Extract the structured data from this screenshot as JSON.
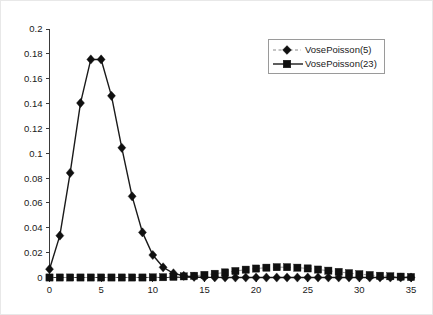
{
  "chart_data": {
    "type": "line",
    "title": "",
    "subtitle": "",
    "xlabel": "",
    "ylabel": "",
    "xlim": [
      0,
      35
    ],
    "ylim": [
      0,
      0.2
    ],
    "grid": false,
    "legend_position": "top-right",
    "x_ticks": [
      "0",
      "5",
      "10",
      "15",
      "20",
      "25",
      "30",
      "35"
    ],
    "x_tick_values": [
      0,
      5,
      10,
      15,
      20,
      25,
      30,
      35
    ],
    "y_ticks": [
      "0",
      "0.02",
      "0.04",
      "0.06",
      "0.08",
      "0.1",
      "0.12",
      "0.14",
      "0.16",
      "0.18",
      "0.2"
    ],
    "y_tick_values": [
      0,
      0.02,
      0.04,
      0.06,
      0.08,
      0.1,
      0.12,
      0.14,
      0.16,
      0.18,
      0.2
    ],
    "x": [
      0,
      1,
      2,
      3,
      4,
      5,
      6,
      7,
      8,
      9,
      10,
      11,
      12,
      13,
      14,
      15,
      16,
      17,
      18,
      19,
      20,
      21,
      22,
      23,
      24,
      25,
      26,
      27,
      28,
      29,
      30,
      31,
      32,
      33,
      34,
      35
    ],
    "series": [
      {
        "name": "VosePoisson(5)",
        "marker": "diamond",
        "line_style": "dashed",
        "color": "#101010",
        "line_color": "#9a9a9a",
        "values": [
          0.0067,
          0.0337,
          0.0842,
          0.1404,
          0.1755,
          0.1755,
          0.1462,
          0.1044,
          0.0653,
          0.0363,
          0.0181,
          0.0082,
          0.0034,
          0.0013,
          0.0005,
          0.0002,
          0.0001,
          0.0,
          0.0,
          0.0,
          0.0,
          0.0,
          0.0,
          0.0,
          0.0,
          0.0,
          0.0,
          0.0,
          0.0,
          0.0,
          0.0,
          0.0,
          0.0,
          0.0,
          0.0,
          0.0
        ]
      },
      {
        "name": "VosePoisson(23)",
        "marker": "square",
        "line_style": "solid",
        "color": "#101010",
        "line_color": "#1a1a1a",
        "values": [
          0.0,
          0.0,
          0.0,
          0.0,
          0.0,
          0.0,
          0.0,
          0.0,
          0.0,
          0.0,
          0.0001,
          0.0002,
          0.0005,
          0.0009,
          0.0014,
          0.0021,
          0.003,
          0.0041,
          0.0052,
          0.0063,
          0.0072,
          0.0079,
          0.0083,
          0.0083,
          0.0079,
          0.0073,
          0.0064,
          0.0055,
          0.0045,
          0.0035,
          0.0027,
          0.002,
          0.0014,
          0.001,
          0.0007,
          0.0004
        ]
      }
    ],
    "series23_scale_note": "values plotted for VosePoisson(23) peak 0.0827 at x=22 and x=23"
  },
  "legend": {
    "entries": [
      {
        "label": "VosePoisson(5)",
        "marker": "diamond",
        "style": "dashed"
      },
      {
        "label": "VosePoisson(23)",
        "marker": "square",
        "style": "solid"
      }
    ]
  }
}
